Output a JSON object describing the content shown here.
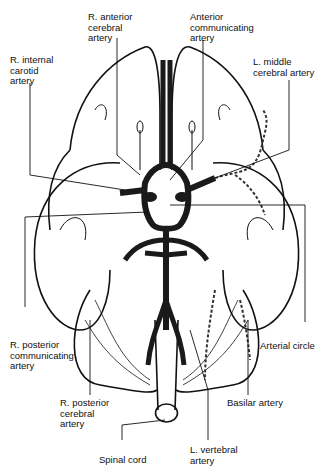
{
  "diagram": {
    "labels": {
      "r_anterior_cerebral": "R. anterior\ncerebral\nartery",
      "anterior_communicating": "Anterior\ncommunicating\nartery",
      "r_internal_carotid": "R. internal\ncarotid\nartery",
      "l_middle_cerebral": "L. middle\ncerebral artery",
      "r_posterior_communicating": "R. posterior\ncommunicating\nartery",
      "arterial_circle": "Arterial circle",
      "r_posterior_cerebral": "R. posterior\ncerebral\nartery",
      "basilar": "Basilar artery",
      "spinal_cord": "Spinal cord",
      "l_vertebral": "L. vertebral\nartery"
    },
    "colors": {
      "line": "#111111",
      "vessel": "#1a1a1a",
      "background": "#ffffff"
    }
  }
}
